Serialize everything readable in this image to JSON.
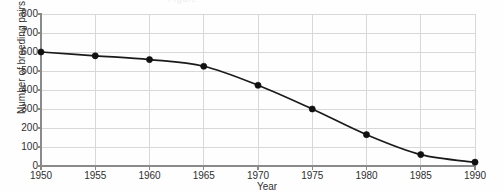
{
  "figure": {
    "scan_ghost_text": "Figure",
    "background_color": "#fefefe",
    "axis_color": "#8a8a8a",
    "grid_color": "#d8d8d8",
    "series_color": "#1a1a1a",
    "marker_color": "#111111"
  },
  "chart_data": {
    "type": "line",
    "title": "",
    "xlabel": "Year",
    "ylabel": "Number of breeding pairs",
    "x": [
      1950,
      1955,
      1960,
      1965,
      1970,
      1975,
      1980,
      1985,
      1990
    ],
    "values": [
      600,
      580,
      560,
      525,
      425,
      300,
      165,
      60,
      20
    ],
    "xtick_labels": [
      "1950",
      "1955",
      "1960",
      "1965",
      "1970",
      "1975",
      "1980",
      "1985",
      "1990"
    ],
    "ytick_labels": [
      "0",
      "100",
      "200",
      "300",
      "400",
      "500",
      "600",
      "700",
      "800"
    ],
    "ytick_values": [
      0,
      100,
      200,
      300,
      400,
      500,
      600,
      700,
      800
    ],
    "xlim": [
      1950,
      1990
    ],
    "ylim": [
      0,
      800
    ],
    "grid": true,
    "legend": false,
    "marker": "filled-circle",
    "smoothing": true
  }
}
